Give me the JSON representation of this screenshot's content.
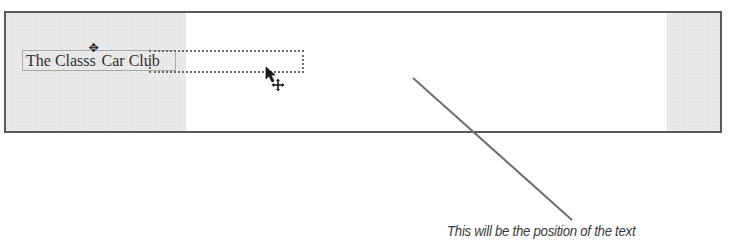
{
  "canvas": {
    "title_text_before": "The Class",
    "title_text_after": " Car Club",
    "title_overlay_glyph": "✥",
    "drop_target": {
      "label": "",
      "style": "dotted"
    },
    "cursor": {
      "type": "arrow-with-move-icon",
      "move_glyph": "✥"
    }
  },
  "annotation": {
    "caption": "This will be the position of the text"
  },
  "colors": {
    "frame_border": "#5a5a5a",
    "frame_background": "#e9e9e9",
    "canvas_background": "#ffffff",
    "leader_line": "#6e6e6e",
    "text": "#2f2f2f"
  }
}
